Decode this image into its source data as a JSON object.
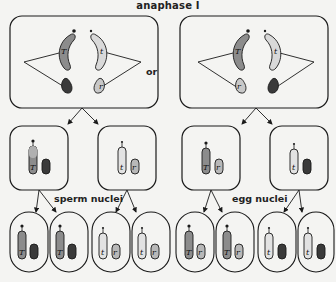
{
  "title": "anaphase I",
  "or_label": "or",
  "labels": {
    "left_group": "sperm nuclei",
    "right_group": "egg nuclei"
  },
  "colors": {
    "outline": "#1a1a1a",
    "dark_chromosome": "#3a3a3a",
    "medium_chromosome": "#8c8c8c",
    "light_chromosome": "#d9d9d9",
    "background": "#f4f4f2"
  },
  "anaphase_cells": [
    {
      "id": "left",
      "chromosomes": [
        {
          "allele": "T",
          "shade": "medium",
          "kind": "long"
        },
        {
          "allele": "t",
          "shade": "light",
          "kind": "long"
        },
        {
          "allele": "R",
          "shade": "dark",
          "kind": "short"
        },
        {
          "allele": "r",
          "shade": "light",
          "kind": "short"
        }
      ]
    },
    {
      "id": "right",
      "chromosomes": [
        {
          "allele": "T",
          "shade": "medium",
          "kind": "long"
        },
        {
          "allele": "t",
          "shade": "light",
          "kind": "long"
        },
        {
          "allele": "r",
          "shade": "light",
          "kind": "short"
        },
        {
          "allele": "R",
          "shade": "dark",
          "kind": "short"
        }
      ]
    }
  ],
  "secondary_cells": [
    {
      "alleles": [
        "T",
        "R"
      ]
    },
    {
      "alleles": [
        "t",
        "r"
      ]
    },
    {
      "alleles": [
        "T",
        "r"
      ]
    },
    {
      "alleles": [
        "t",
        "R"
      ]
    }
  ],
  "gamete_nuclei": [
    {
      "group": "sperm",
      "alleles": [
        "T",
        "R"
      ]
    },
    {
      "group": "sperm",
      "alleles": [
        "T",
        "R"
      ]
    },
    {
      "group": "sperm",
      "alleles": [
        "t",
        "r"
      ]
    },
    {
      "group": "sperm",
      "alleles": [
        "t",
        "r"
      ]
    },
    {
      "group": "egg",
      "alleles": [
        "T",
        "r"
      ]
    },
    {
      "group": "egg",
      "alleles": [
        "T",
        "r"
      ]
    },
    {
      "group": "egg",
      "alleles": [
        "t",
        "R"
      ]
    },
    {
      "group": "egg",
      "alleles": [
        "t",
        "R"
      ]
    }
  ]
}
